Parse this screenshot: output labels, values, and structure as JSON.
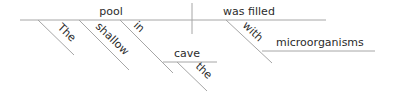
{
  "diagram": {
    "type": "reed-kellogg-sentence-diagram",
    "sentence_words": {
      "subject": "pool",
      "verb": "was filled",
      "modifiers": {
        "article": "The",
        "adjective": "shallow",
        "preposition_subject": "in",
        "prep_object": "cave",
        "prep_object_article": "the",
        "preposition_verb": "with",
        "verb_prep_object": "microorganisms"
      }
    },
    "colors": {
      "line": "#a6a6a6",
      "text": "#2b2b2b"
    }
  }
}
